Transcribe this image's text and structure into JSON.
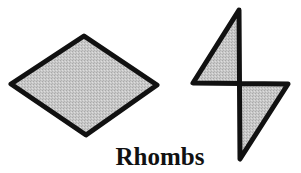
{
  "caption": "Rhombs",
  "colors": {
    "fill": "#c4c4c4",
    "stroke": "#111111",
    "background": "#ffffff"
  },
  "shapes": [
    {
      "name": "horizontal-rhombus",
      "points": "11,84 84,36 157,85 86,135"
    },
    {
      "name": "vertical-rhombus",
      "points": "239,10 193,83 288,84 240,159"
    }
  ]
}
